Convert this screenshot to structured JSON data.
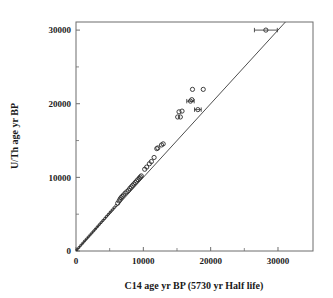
{
  "chart_data": {
    "type": "scatter",
    "title": "",
    "xlabel": "C14 age yr BP (5730 yr Half life)",
    "ylabel": "U/Th age yr BP",
    "xlim": [
      0,
      35200
    ],
    "ylim": [
      0,
      31100
    ],
    "xticks": [
      0,
      10000,
      20000,
      30000
    ],
    "yticks": [
      0,
      10000,
      20000,
      30000
    ],
    "xtick_labels": [
      "0",
      "10000",
      "20000",
      "30000"
    ],
    "ytick_labels": [
      "0",
      "10000",
      "20000",
      "30000"
    ],
    "minor_xticks": [
      5000,
      15000,
      25000
    ],
    "minor_yticks": [
      5000,
      15000,
      25000
    ],
    "grid": false,
    "legend": null,
    "reference_line": {
      "name": "1:1 identity line",
      "x": [
        0,
        35200
      ],
      "y": [
        0,
        35200
      ]
    },
    "marker_style": "open-circle",
    "series": [
      {
        "name": "U/Th vs C14 paired ages",
        "marker": "open-circle",
        "points": [
          {
            "x": 150,
            "y": 180
          },
          {
            "x": 420,
            "y": 460
          },
          {
            "x": 700,
            "y": 760
          },
          {
            "x": 980,
            "y": 1040
          },
          {
            "x": 1250,
            "y": 1330
          },
          {
            "x": 1520,
            "y": 1600
          },
          {
            "x": 1800,
            "y": 1880
          },
          {
            "x": 2080,
            "y": 2170
          },
          {
            "x": 2360,
            "y": 2450
          },
          {
            "x": 2640,
            "y": 2740
          },
          {
            "x": 2900,
            "y": 3010
          },
          {
            "x": 3180,
            "y": 3300
          },
          {
            "x": 3450,
            "y": 3580
          },
          {
            "x": 3720,
            "y": 3860
          },
          {
            "x": 4000,
            "y": 4150
          },
          {
            "x": 4280,
            "y": 4430
          },
          {
            "x": 4550,
            "y": 4720
          },
          {
            "x": 4830,
            "y": 5010
          },
          {
            "x": 5100,
            "y": 5300
          },
          {
            "x": 5380,
            "y": 5580
          },
          {
            "x": 5650,
            "y": 5880
          },
          {
            "x": 5930,
            "y": 6170
          },
          {
            "x": 6200,
            "y": 6500
          },
          {
            "x": 6400,
            "y": 6800
          },
          {
            "x": 6550,
            "y": 7050
          },
          {
            "x": 6700,
            "y": 7250
          },
          {
            "x": 6850,
            "y": 7400
          },
          {
            "x": 7050,
            "y": 7600
          },
          {
            "x": 7300,
            "y": 7850
          },
          {
            "x": 7550,
            "y": 8050
          },
          {
            "x": 7800,
            "y": 8250
          },
          {
            "x": 8000,
            "y": 8500
          },
          {
            "x": 8200,
            "y": 8700
          },
          {
            "x": 8400,
            "y": 8900
          },
          {
            "x": 8600,
            "y": 9100
          },
          {
            "x": 8800,
            "y": 9300
          },
          {
            "x": 9000,
            "y": 9500
          },
          {
            "x": 9200,
            "y": 9700
          },
          {
            "x": 9400,
            "y": 9900
          },
          {
            "x": 9550,
            "y": 10050
          },
          {
            "x": 9700,
            "y": 10200
          },
          {
            "x": 10200,
            "y": 11100
          },
          {
            "x": 10500,
            "y": 11400
          },
          {
            "x": 10900,
            "y": 11850
          },
          {
            "x": 11200,
            "y": 12150
          },
          {
            "x": 11600,
            "y": 12700
          },
          {
            "x": 12000,
            "y": 13900
          },
          {
            "x": 12150,
            "y": 14000
          },
          {
            "x": 12700,
            "y": 14400
          },
          {
            "x": 12950,
            "y": 14550
          },
          {
            "x": 15100,
            "y": 18200
          },
          {
            "x": 15300,
            "y": 18900
          },
          {
            "x": 15500,
            "y": 18200
          },
          {
            "x": 15750,
            "y": 19000
          },
          {
            "x": 17000,
            "y": 20350
          },
          {
            "x": 17200,
            "y": 20550
          },
          {
            "x": 17300,
            "y": 21950
          },
          {
            "x": 18100,
            "y": 19200
          },
          {
            "x": 18900,
            "y": 21950
          },
          {
            "x": 28200,
            "y": 30000
          }
        ],
        "points_with_errorbars": [
          {
            "x": 28200,
            "y": 30000,
            "xerr": 1700
          },
          {
            "x": 17000,
            "y": 20350,
            "xerr": 550
          },
          {
            "x": 18100,
            "y": 19200,
            "xerr": 500
          }
        ],
        "small_dot_points": [
          {
            "x": 100,
            "y": 120
          },
          {
            "x": 300,
            "y": 330
          },
          {
            "x": 520,
            "y": 560
          },
          {
            "x": 760,
            "y": 810
          },
          {
            "x": 1000,
            "y": 1060
          },
          {
            "x": 1240,
            "y": 1310
          },
          {
            "x": 1480,
            "y": 1560
          },
          {
            "x": 1720,
            "y": 1810
          },
          {
            "x": 1960,
            "y": 2060
          },
          {
            "x": 2200,
            "y": 2310
          },
          {
            "x": 2440,
            "y": 2560
          },
          {
            "x": 2680,
            "y": 2810
          },
          {
            "x": 2920,
            "y": 3060
          },
          {
            "x": 3160,
            "y": 3310
          },
          {
            "x": 3400,
            "y": 3560
          },
          {
            "x": 3640,
            "y": 3810
          },
          {
            "x": 3880,
            "y": 4060
          },
          {
            "x": 4120,
            "y": 4310
          },
          {
            "x": 4360,
            "y": 4560
          },
          {
            "x": 4600,
            "y": 4810
          },
          {
            "x": 4840,
            "y": 5060
          },
          {
            "x": 5080,
            "y": 5310
          },
          {
            "x": 5320,
            "y": 5560
          },
          {
            "x": 5560,
            "y": 5810
          }
        ]
      }
    ]
  }
}
